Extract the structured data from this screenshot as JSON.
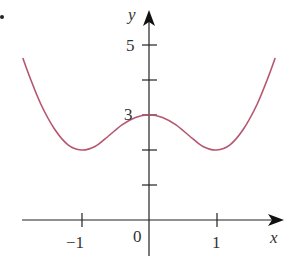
{
  "colors": {
    "axis": "#222222",
    "curve": "#b5566e",
    "text": "#333333"
  },
  "chart_data": {
    "type": "line",
    "title": "",
    "xlabel": "x",
    "ylabel": "y",
    "x_tick_labels": [
      "−1",
      "0",
      "1"
    ],
    "y_tick_labels": [
      "3",
      "5"
    ],
    "x_ticks": [
      -1,
      1
    ],
    "y_ticks": [
      1,
      2,
      3,
      4,
      5
    ],
    "xlim": [
      -1.9,
      1.9
    ],
    "ylim": [
      -1,
      5.2
    ],
    "grid": false,
    "legend": null,
    "series": [
      {
        "name": "curve",
        "description": "symmetric W-shaped curve, local max (0,3), minima at (±1,2)",
        "x": [
          -1.87,
          -1.75,
          -1.6,
          -1.4,
          -1.2,
          -1.0,
          -0.8,
          -0.6,
          -0.4,
          -0.2,
          0,
          0.2,
          0.4,
          0.6,
          0.8,
          1.0,
          1.2,
          1.4,
          1.6,
          1.75,
          1.87
        ],
        "y": [
          4.63,
          4.0,
          3.3,
          2.6,
          2.15,
          2.0,
          2.1,
          2.4,
          2.72,
          2.93,
          3.0,
          2.93,
          2.72,
          2.4,
          2.1,
          2.0,
          2.15,
          2.6,
          3.3,
          4.0,
          4.63
        ]
      }
    ]
  },
  "labels": {
    "x_axis": "x",
    "y_axis": "y",
    "x_neg1": "−1",
    "x_zero": "0",
    "x_one": "1",
    "y_three": "3",
    "y_five": "5"
  }
}
